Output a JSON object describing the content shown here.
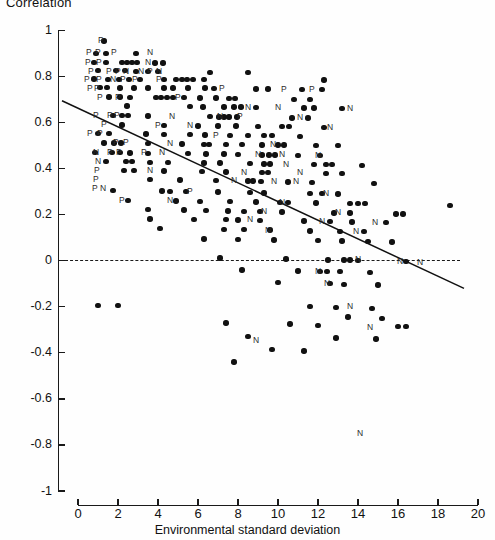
{
  "chart_data": {
    "type": "scatter",
    "title": "Correlation",
    "xlabel": "Environmental standard deviation",
    "ylabel": "Correlation",
    "xlim": [
      0,
      20
    ],
    "ylim": [
      -1,
      1
    ],
    "xticks": [
      0,
      2,
      4,
      6,
      8,
      10,
      12,
      14,
      16,
      18,
      20
    ],
    "xtick_labels": [
      "0",
      "2",
      "4",
      "6",
      "8",
      "10",
      "12",
      "14",
      "16",
      "18",
      "20"
    ],
    "yticks": [
      1,
      0.8,
      0.6,
      0.4,
      0.2,
      0,
      -0.2,
      -0.4,
      -0.6,
      -0.8,
      -1
    ],
    "ytick_labels": [
      "1",
      "0.8",
      "0.6",
      "0.4",
      "0.2",
      "0",
      "-0.2",
      "-0.4",
      "-0.6",
      "-0.8",
      "-1"
    ],
    "grid": false,
    "legend": "none",
    "marker": "filled-circle",
    "annotations": {
      "zero_reference_line": {
        "y": 0,
        "style": "dashed",
        "x_from": 0,
        "x_to": 19.1
      },
      "regression_line": {
        "style": "solid",
        "x_from": 0.1,
        "x_to": 19.3,
        "y_from": 0.695,
        "y_to": -0.12
      }
    },
    "point_labels": {
      "P": "positive-association marker",
      "N": "negative-association marker"
    },
    "points": [
      [
        1.3,
        0.955
      ],
      [
        0.9,
        0.9
      ],
      [
        1.4,
        0.9
      ],
      [
        2.9,
        0.9
      ],
      [
        0.8,
        0.86
      ],
      [
        1.4,
        0.86
      ],
      [
        2.2,
        0.862
      ],
      [
        2.45,
        0.862
      ],
      [
        2.7,
        0.862
      ],
      [
        2.95,
        0.862
      ],
      [
        3.85,
        0.858
      ],
      [
        4.25,
        0.858
      ],
      [
        1.0,
        0.825
      ],
      [
        1.9,
        0.825
      ],
      [
        2.35,
        0.825
      ],
      [
        2.9,
        0.822
      ],
      [
        3.5,
        0.822
      ],
      [
        4.0,
        0.822
      ],
      [
        6.6,
        0.818
      ],
      [
        8.5,
        0.818
      ],
      [
        0.8,
        0.79
      ],
      [
        1.5,
        0.788
      ],
      [
        2.05,
        0.788
      ],
      [
        2.55,
        0.788
      ],
      [
        3.1,
        0.788
      ],
      [
        4.3,
        0.787
      ],
      [
        4.9,
        0.787
      ],
      [
        5.2,
        0.787
      ],
      [
        5.45,
        0.787
      ],
      [
        5.75,
        0.787
      ],
      [
        6.3,
        0.787
      ],
      [
        12.3,
        0.785
      ],
      [
        1.1,
        0.752
      ],
      [
        1.45,
        0.752
      ],
      [
        2.1,
        0.75
      ],
      [
        2.8,
        0.75
      ],
      [
        3.5,
        0.75
      ],
      [
        4.3,
        0.75
      ],
      [
        4.75,
        0.75
      ],
      [
        5.5,
        0.75
      ],
      [
        6.35,
        0.75
      ],
      [
        6.8,
        0.748
      ],
      [
        8.9,
        0.746
      ],
      [
        9.5,
        0.746
      ],
      [
        11.2,
        0.744
      ],
      [
        12.2,
        0.744
      ],
      [
        1.55,
        0.712
      ],
      [
        2.1,
        0.712
      ],
      [
        2.6,
        0.71
      ],
      [
        3.9,
        0.708
      ],
      [
        4.15,
        0.708
      ],
      [
        4.45,
        0.708
      ],
      [
        4.75,
        0.708
      ],
      [
        5.3,
        0.708
      ],
      [
        6.1,
        0.706
      ],
      [
        6.9,
        0.706
      ],
      [
        7.55,
        0.705
      ],
      [
        7.85,
        0.705
      ],
      [
        10.8,
        0.7
      ],
      [
        11.6,
        0.7
      ],
      [
        2.45,
        0.672
      ],
      [
        5.6,
        0.67
      ],
      [
        6.25,
        0.668
      ],
      [
        7.3,
        0.668
      ],
      [
        7.8,
        0.667
      ],
      [
        8.15,
        0.667
      ],
      [
        8.9,
        0.666
      ],
      [
        11.3,
        0.664
      ],
      [
        11.8,
        0.664
      ],
      [
        13.2,
        0.662
      ],
      [
        1.75,
        0.63
      ],
      [
        2.2,
        0.63
      ],
      [
        2.5,
        0.63
      ],
      [
        3.5,
        0.628
      ],
      [
        6.6,
        0.626
      ],
      [
        7.05,
        0.625
      ],
      [
        7.3,
        0.625
      ],
      [
        7.55,
        0.625
      ],
      [
        7.95,
        0.625
      ],
      [
        10.7,
        0.62
      ],
      [
        11.5,
        0.62
      ],
      [
        2.2,
        0.59
      ],
      [
        4.3,
        0.588
      ],
      [
        6.0,
        0.586
      ],
      [
        7.0,
        0.586
      ],
      [
        7.9,
        0.585
      ],
      [
        9.0,
        0.584
      ],
      [
        10.2,
        0.582
      ],
      [
        10.55,
        0.582
      ],
      [
        12.3,
        0.58
      ],
      [
        1.0,
        0.552
      ],
      [
        1.55,
        0.552
      ],
      [
        3.4,
        0.55
      ],
      [
        4.3,
        0.548
      ],
      [
        5.6,
        0.547
      ],
      [
        6.35,
        0.546
      ],
      [
        7.6,
        0.545
      ],
      [
        8.5,
        0.544
      ],
      [
        9.3,
        0.543
      ],
      [
        9.7,
        0.543
      ],
      [
        11.1,
        0.54
      ],
      [
        1.3,
        0.512
      ],
      [
        1.8,
        0.512
      ],
      [
        2.15,
        0.512
      ],
      [
        3.5,
        0.508
      ],
      [
        5.2,
        0.507
      ],
      [
        6.3,
        0.506
      ],
      [
        6.55,
        0.506
      ],
      [
        7.4,
        0.505
      ],
      [
        8.2,
        0.504
      ],
      [
        9.2,
        0.503
      ],
      [
        10.0,
        0.502
      ],
      [
        10.3,
        0.502
      ],
      [
        11.9,
        0.5
      ],
      [
        13.0,
        0.5
      ],
      [
        0.85,
        0.47
      ],
      [
        1.7,
        0.47
      ],
      [
        2.1,
        0.47
      ],
      [
        2.6,
        0.468
      ],
      [
        3.5,
        0.466
      ],
      [
        5.5,
        0.465
      ],
      [
        6.4,
        0.464
      ],
      [
        7.3,
        0.463
      ],
      [
        8.0,
        0.462
      ],
      [
        9.2,
        0.46
      ],
      [
        9.55,
        0.46
      ],
      [
        9.85,
        0.46
      ],
      [
        11.0,
        0.458
      ],
      [
        12.1,
        0.456
      ],
      [
        1.4,
        0.432
      ],
      [
        2.4,
        0.43
      ],
      [
        2.7,
        0.43
      ],
      [
        3.6,
        0.428
      ],
      [
        4.5,
        0.427
      ],
      [
        6.3,
        0.425
      ],
      [
        7.1,
        0.424
      ],
      [
        8.6,
        0.422
      ],
      [
        9.3,
        0.42
      ],
      [
        9.6,
        0.42
      ],
      [
        11.8,
        0.417
      ],
      [
        12.4,
        0.417
      ],
      [
        12.7,
        0.417
      ],
      [
        14.2,
        0.414
      ],
      [
        2.3,
        0.392
      ],
      [
        2.8,
        0.392
      ],
      [
        4.3,
        0.39
      ],
      [
        6.2,
        0.388
      ],
      [
        7.4,
        0.386
      ],
      [
        9.2,
        0.384
      ],
      [
        9.5,
        0.384
      ],
      [
        12.4,
        0.38
      ],
      [
        13.2,
        0.38
      ],
      [
        3.6,
        0.352
      ],
      [
        5.1,
        0.35
      ],
      [
        6.9,
        0.348
      ],
      [
        8.5,
        0.346
      ],
      [
        8.75,
        0.346
      ],
      [
        9.15,
        0.345
      ],
      [
        10.5,
        0.342
      ],
      [
        11.7,
        0.34
      ],
      [
        14.8,
        0.336
      ],
      [
        1.75,
        0.305
      ],
      [
        4.2,
        0.303
      ],
      [
        4.6,
        0.302
      ],
      [
        5.4,
        0.3
      ],
      [
        7.0,
        0.298
      ],
      [
        8.6,
        0.296
      ],
      [
        9.3,
        0.295
      ],
      [
        11.6,
        0.292
      ],
      [
        12.2,
        0.292
      ],
      [
        13.0,
        0.29
      ],
      [
        2.5,
        0.262
      ],
      [
        4.9,
        0.26
      ],
      [
        6.1,
        0.258
      ],
      [
        7.6,
        0.256
      ],
      [
        8.9,
        0.255
      ],
      [
        10.1,
        0.253
      ],
      [
        10.5,
        0.253
      ],
      [
        11.9,
        0.25
      ],
      [
        13.6,
        0.248
      ],
      [
        14.0,
        0.248
      ],
      [
        14.35,
        0.248
      ],
      [
        18.6,
        0.24
      ],
      [
        3.5,
        0.222
      ],
      [
        5.3,
        0.22
      ],
      [
        6.4,
        0.218
      ],
      [
        7.5,
        0.216
      ],
      [
        8.3,
        0.215
      ],
      [
        9.1,
        0.214
      ],
      [
        10.2,
        0.212
      ],
      [
        12.8,
        0.208
      ],
      [
        13.6,
        0.207
      ],
      [
        15.9,
        0.203
      ],
      [
        16.25,
        0.203
      ],
      [
        3.6,
        0.182
      ],
      [
        5.8,
        0.18
      ],
      [
        7.4,
        0.178
      ],
      [
        8.0,
        0.177
      ],
      [
        9.1,
        0.176
      ],
      [
        11.3,
        0.173
      ],
      [
        12.6,
        0.17
      ],
      [
        13.7,
        0.169
      ],
      [
        15.4,
        0.166
      ],
      [
        4.1,
        0.14
      ],
      [
        7.3,
        0.136
      ],
      [
        8.3,
        0.135
      ],
      [
        9.6,
        0.133
      ],
      [
        11.6,
        0.13
      ],
      [
        13.1,
        0.128
      ],
      [
        14.3,
        0.126
      ],
      [
        6.3,
        0.095
      ],
      [
        8.0,
        0.093
      ],
      [
        9.8,
        0.09
      ],
      [
        12.0,
        0.087
      ],
      [
        13.2,
        0.085
      ],
      [
        14.5,
        0.083
      ],
      [
        15.7,
        0.081
      ],
      [
        7.1,
        0.012
      ],
      [
        10.4,
        0.008
      ],
      [
        12.5,
        0.004
      ],
      [
        13.3,
        0.003
      ],
      [
        13.6,
        0.003
      ],
      [
        14.0,
        0.002
      ],
      [
        16.4,
        -0.002
      ],
      [
        8.2,
        -0.04
      ],
      [
        11.0,
        -0.044
      ],
      [
        12.1,
        -0.046
      ],
      [
        12.45,
        -0.046
      ],
      [
        13.1,
        -0.048
      ],
      [
        14.6,
        -0.05
      ],
      [
        10.0,
        -0.095
      ],
      [
        12.6,
        -0.1
      ],
      [
        13.3,
        -0.102
      ],
      [
        15.0,
        -0.105
      ],
      [
        1.0,
        -0.195
      ],
      [
        2.0,
        -0.195
      ],
      [
        11.6,
        -0.2
      ],
      [
        12.9,
        -0.204
      ],
      [
        14.7,
        -0.208
      ],
      [
        13.5,
        -0.245
      ],
      [
        15.2,
        -0.25
      ],
      [
        7.4,
        -0.27
      ],
      [
        10.6,
        -0.275
      ],
      [
        12.0,
        -0.28
      ],
      [
        16.0,
        -0.285
      ],
      [
        16.4,
        -0.285
      ],
      [
        8.5,
        -0.33
      ],
      [
        12.9,
        -0.335
      ],
      [
        14.9,
        -0.34
      ],
      [
        7.8,
        -0.44
      ],
      [
        9.7,
        -0.385
      ],
      [
        11.3,
        -0.392
      ]
    ],
    "text_markers": [
      {
        "t": "P",
        "x": 1.15,
        "y": 0.955
      },
      {
        "t": "P",
        "x": 0.55,
        "y": 0.905
      },
      {
        "t": "P",
        "x": 1.0,
        "y": 0.905
      },
      {
        "t": "P",
        "x": 1.8,
        "y": 0.905
      },
      {
        "t": "N",
        "x": 3.6,
        "y": 0.905
      },
      {
        "t": "P",
        "x": 0.5,
        "y": 0.862
      },
      {
        "t": "P",
        "x": 1.05,
        "y": 0.862
      },
      {
        "t": "N",
        "x": 3.5,
        "y": 0.862
      },
      {
        "t": "P",
        "x": 0.65,
        "y": 0.824
      },
      {
        "t": "P",
        "x": 1.55,
        "y": 0.824
      },
      {
        "t": "P",
        "x": 2.0,
        "y": 0.824
      },
      {
        "t": "N",
        "x": 2.4,
        "y": 0.824
      },
      {
        "t": "N",
        "x": 3.15,
        "y": 0.824
      },
      {
        "t": "P",
        "x": 3.6,
        "y": 0.824
      },
      {
        "t": "N",
        "x": 4.05,
        "y": 0.824
      },
      {
        "t": "P",
        "x": 0.45,
        "y": 0.787
      },
      {
        "t": "P",
        "x": 1.05,
        "y": 0.787
      },
      {
        "t": "N",
        "x": 1.75,
        "y": 0.787
      },
      {
        "t": "P",
        "x": 2.25,
        "y": 0.787
      },
      {
        "t": "P",
        "x": 2.85,
        "y": 0.787
      },
      {
        "t": "P",
        "x": 4.05,
        "y": 0.787
      },
      {
        "t": "P",
        "x": 0.6,
        "y": 0.75
      },
      {
        "t": "P",
        "x": 0.95,
        "y": 0.75
      },
      {
        "t": "P",
        "x": 7.2,
        "y": 0.748
      },
      {
        "t": "P",
        "x": 10.3,
        "y": 0.744
      },
      {
        "t": "P",
        "x": 11.7,
        "y": 0.744
      },
      {
        "t": "P",
        "x": 1.1,
        "y": 0.71
      },
      {
        "t": "P",
        "x": 2.0,
        "y": 0.71
      },
      {
        "t": "P",
        "x": 5.0,
        "y": 0.708
      },
      {
        "t": "N",
        "x": 8.5,
        "y": 0.666
      },
      {
        "t": "N",
        "x": 10.0,
        "y": 0.665
      },
      {
        "t": "N",
        "x": 13.6,
        "y": 0.662
      },
      {
        "t": "P",
        "x": 0.9,
        "y": 0.63
      },
      {
        "t": "P",
        "x": 1.6,
        "y": 0.63
      },
      {
        "t": "P",
        "x": 1.95,
        "y": 0.63
      },
      {
        "t": "N",
        "x": 4.7,
        "y": 0.628
      },
      {
        "t": "N",
        "x": 7.1,
        "y": 0.625
      },
      {
        "t": "P",
        "x": 8.1,
        "y": 0.625
      },
      {
        "t": "N",
        "x": 11.1,
        "y": 0.62
      },
      {
        "t": "P",
        "x": 1.3,
        "y": 0.59
      },
      {
        "t": "P",
        "x": 4.0,
        "y": 0.588
      },
      {
        "t": "N",
        "x": 5.6,
        "y": 0.586
      },
      {
        "t": "N",
        "x": 12.6,
        "y": 0.58
      },
      {
        "t": "P",
        "x": 0.6,
        "y": 0.552
      },
      {
        "t": "P",
        "x": 1.1,
        "y": 0.552
      },
      {
        "t": "P",
        "x": 6.9,
        "y": 0.545
      },
      {
        "t": "P",
        "x": 1.9,
        "y": 0.512
      },
      {
        "t": "P",
        "x": 2.4,
        "y": 0.512
      },
      {
        "t": "N",
        "x": 4.6,
        "y": 0.508
      },
      {
        "t": "N",
        "x": 9.75,
        "y": 0.503
      },
      {
        "t": "N",
        "x": 0.9,
        "y": 0.47
      },
      {
        "t": "P",
        "x": 1.6,
        "y": 0.47
      },
      {
        "t": "P",
        "x": 2.05,
        "y": 0.47
      },
      {
        "t": "P",
        "x": 3.3,
        "y": 0.468
      },
      {
        "t": "N",
        "x": 4.2,
        "y": 0.468
      },
      {
        "t": "N",
        "x": 9.0,
        "y": 0.46
      },
      {
        "t": "N",
        "x": 10.2,
        "y": 0.46
      },
      {
        "t": "N",
        "x": 12.0,
        "y": 0.456
      },
      {
        "t": "N",
        "x": 1.0,
        "y": 0.432
      },
      {
        "t": "N",
        "x": 10.4,
        "y": 0.42
      },
      {
        "t": "P",
        "x": 0.95,
        "y": 0.392
      },
      {
        "t": "N",
        "x": 3.6,
        "y": 0.39
      },
      {
        "t": "N",
        "x": 8.3,
        "y": 0.384
      },
      {
        "t": "N",
        "x": 11.1,
        "y": 0.382
      },
      {
        "t": "P",
        "x": 0.9,
        "y": 0.352
      },
      {
        "t": "N",
        "x": 7.8,
        "y": 0.348
      },
      {
        "t": "N",
        "x": 9.8,
        "y": 0.345
      },
      {
        "t": "N",
        "x": 10.9,
        "y": 0.344
      },
      {
        "t": "P",
        "x": 0.85,
        "y": 0.312
      },
      {
        "t": "N",
        "x": 1.25,
        "y": 0.312
      },
      {
        "t": "P",
        "x": 5.6,
        "y": 0.3
      },
      {
        "t": "N",
        "x": 12.4,
        "y": 0.292
      },
      {
        "t": "P",
        "x": 2.2,
        "y": 0.262
      },
      {
        "t": "N",
        "x": 4.6,
        "y": 0.26
      },
      {
        "t": "N",
        "x": 10.2,
        "y": 0.253
      },
      {
        "t": "N",
        "x": 9.3,
        "y": 0.214
      },
      {
        "t": "N",
        "x": 13.0,
        "y": 0.208
      },
      {
        "t": "N",
        "x": 8.6,
        "y": 0.177
      },
      {
        "t": "N",
        "x": 12.2,
        "y": 0.17
      },
      {
        "t": "N",
        "x": 14.85,
        "y": 0.166
      },
      {
        "t": "N",
        "x": 9.5,
        "y": 0.133
      },
      {
        "t": "N",
        "x": 13.9,
        "y": 0.126
      },
      {
        "t": "N",
        "x": 14.0,
        "y": 0.004
      },
      {
        "t": "N",
        "x": 16.1,
        "y": -0.002
      },
      {
        "t": "N",
        "x": 17.1,
        "y": -0.006
      },
      {
        "t": "N",
        "x": 12.0,
        "y": -0.046
      },
      {
        "t": "N",
        "x": 12.45,
        "y": -0.1
      },
      {
        "t": "N",
        "x": 13.6,
        "y": -0.2
      },
      {
        "t": "N",
        "x": 14.6,
        "y": -0.29
      },
      {
        "t": "N",
        "x": 8.9,
        "y": -0.345
      },
      {
        "t": "N",
        "x": 14.1,
        "y": -0.75
      }
    ]
  }
}
